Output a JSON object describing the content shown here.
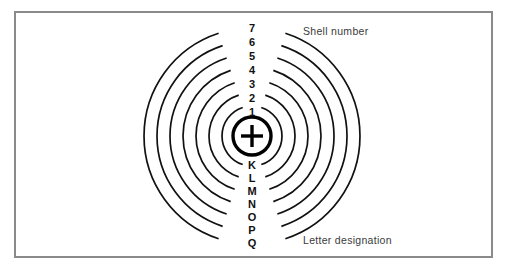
{
  "figure": {
    "background_color": "#ffffff",
    "frame_color": "#8a8a8a",
    "line_color": "#111111"
  },
  "nucleus": {
    "symbol": "+",
    "name": "nucleus",
    "center_x": 252,
    "center_y": 136,
    "radius": 19
  },
  "annotations": {
    "shell_number_label": "Shell number",
    "letter_designation_label": "Letter designation"
  },
  "chart_data": {
    "type": "diagram",
    "center": {
      "x": 252,
      "y": 136
    },
    "shells": [
      {
        "number": "1",
        "letter": "K",
        "radius": 30,
        "number_y": 112,
        "letter_y": 165
      },
      {
        "number": "2",
        "letter": "L",
        "radius": 43,
        "number_y": 98,
        "letter_y": 178
      },
      {
        "number": "3",
        "letter": "M",
        "radius": 56,
        "number_y": 84,
        "letter_y": 191
      },
      {
        "number": "4",
        "letter": "N",
        "radius": 69,
        "number_y": 70,
        "letter_y": 204
      },
      {
        "number": "5",
        "letter": "O",
        "radius": 82,
        "number_y": 56,
        "letter_y": 217
      },
      {
        "number": "6",
        "letter": "P",
        "radius": 95,
        "number_y": 42,
        "letter_y": 230
      },
      {
        "number": "7",
        "letter": "Q",
        "radius": 108,
        "number_y": 28,
        "letter_y": 243
      }
    ],
    "shell_numbers_top_to_bottom": [
      "7",
      "6",
      "5",
      "4",
      "3",
      "2",
      "1"
    ],
    "letter_designations_top_to_bottom": [
      "K",
      "L",
      "M",
      "N",
      "O",
      "P",
      "Q"
    ],
    "label_gap_degrees": 18,
    "legend": [
      "Shell number",
      "Letter designation"
    ]
  }
}
